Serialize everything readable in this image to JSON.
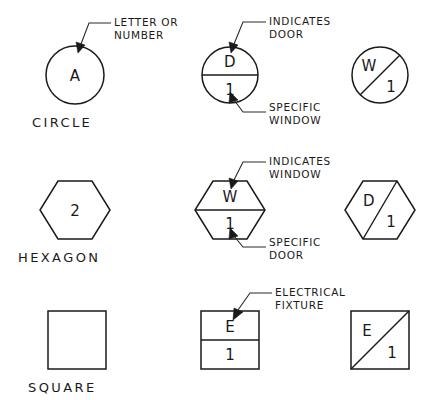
{
  "sheet": {
    "title": "Architectural Reference Symbols",
    "background_color": "#ffffff",
    "ink_color": "#1a1a1a"
  },
  "rows": [
    {
      "id": "circle-row",
      "shape_label": "CIRCLE",
      "plain": {
        "glyph": "A",
        "divider": "none"
      },
      "annotated": {
        "top_glyph": "D",
        "bottom_glyph": "1",
        "divider": "horizontal"
      },
      "variant": {
        "top_glyph": "W",
        "bottom_glyph": "1",
        "divider": "diagonal"
      },
      "callouts": [
        {
          "id": "letter-or-number",
          "line1": "LETTER OR",
          "line2": "NUMBER"
        },
        {
          "id": "indicates-door",
          "line1": "INDICATES",
          "line2": "DOOR"
        },
        {
          "id": "specific-window",
          "line1": "SPECIFIC",
          "line2": "WINDOW"
        }
      ]
    },
    {
      "id": "hexagon-row",
      "shape_label": "HEXAGON",
      "plain": {
        "glyph": "2",
        "divider": "none"
      },
      "annotated": {
        "top_glyph": "W",
        "bottom_glyph": "1",
        "divider": "horizontal"
      },
      "variant": {
        "top_glyph": "D",
        "bottom_glyph": "1",
        "divider": "diagonal"
      },
      "callouts": [
        {
          "id": "indicates-window",
          "line1": "INDICATES",
          "line2": "WINDOW"
        },
        {
          "id": "specific-door",
          "line1": "SPECIFIC",
          "line2": "DOOR"
        }
      ]
    },
    {
      "id": "square-row",
      "shape_label": "SQUARE",
      "plain": {
        "glyph": "",
        "divider": "none"
      },
      "annotated": {
        "top_glyph": "E",
        "bottom_glyph": "1",
        "divider": "horizontal"
      },
      "variant": {
        "top_glyph": "E",
        "bottom_glyph": "1",
        "divider": "diagonal"
      },
      "callouts": [
        {
          "id": "electrical-fixture",
          "line1": "ELECTRICAL",
          "line2": "FIXTURE"
        }
      ]
    }
  ]
}
